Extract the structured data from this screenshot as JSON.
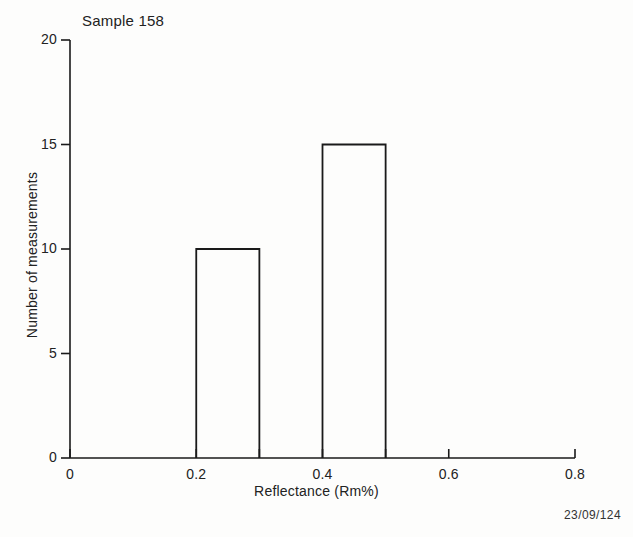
{
  "figure": {
    "background_color": "#fdfdfc",
    "ink_color": "#1a1a1a",
    "corner_stamp": "23/09/124"
  },
  "chart_data": {
    "type": "bar",
    "title": "Sample 158",
    "xlabel": "Reflectance (Rm%)",
    "ylabel": "Number of measurements",
    "xlim": [
      0,
      0.8
    ],
    "ylim": [
      0,
      20
    ],
    "grid": false,
    "legend": false,
    "bar_style": "unfilled-outline",
    "categories": [
      "0.2-0.3",
      "0.4-0.5"
    ],
    "values": [
      10,
      15
    ],
    "bins": [
      {
        "label": "0.2-0.3",
        "x_start": 0.2,
        "x_end": 0.3,
        "value": 10
      },
      {
        "label": "0.4-0.5",
        "x_start": 0.4,
        "x_end": 0.5,
        "value": 15
      }
    ],
    "xticks": [
      {
        "value": 0,
        "label": "0"
      },
      {
        "value": 0.2,
        "label": "0.2"
      },
      {
        "value": 0.3,
        "label": ""
      },
      {
        "value": 0.4,
        "label": "0.4"
      },
      {
        "value": 0.5,
        "label": ""
      },
      {
        "value": 0.6,
        "label": "0.6"
      },
      {
        "value": 0.8,
        "label": "0.8"
      }
    ],
    "yticks": [
      {
        "value": 0,
        "label": "0"
      },
      {
        "value": 5,
        "label": "5"
      },
      {
        "value": 10,
        "label": "10"
      },
      {
        "value": 15,
        "label": "15"
      },
      {
        "value": 20,
        "label": "20"
      }
    ]
  }
}
